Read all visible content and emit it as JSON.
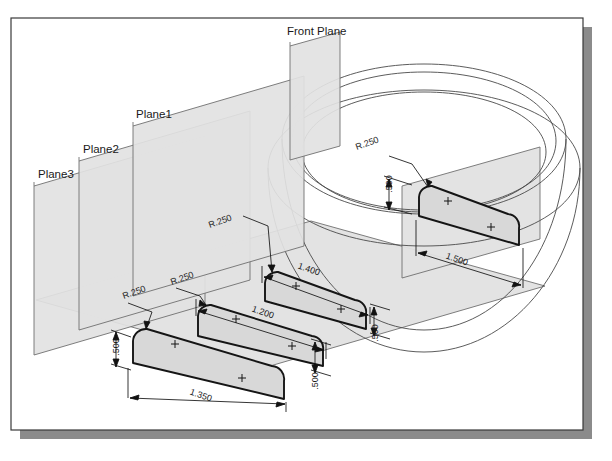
{
  "canvas": {
    "width": 612,
    "height": 461,
    "background": "#ffffff"
  },
  "frame": {
    "name": "drawing-border",
    "x": 11,
    "y": 18,
    "width": 572,
    "height": 412,
    "stroke": "#3a3a3a",
    "shadow_color": "#8b8b8b",
    "shadow_offset": 9
  },
  "style": {
    "plane_fill": "#e2e2e2",
    "plane_stroke": "#6f6f6f",
    "profile_fill": "#d6d6d6",
    "profile_stroke": "#151515",
    "surface_stroke": "#4a4a4a",
    "dimension_stroke": "#121212",
    "text_color": "#1a1a1a"
  },
  "planes": [
    {
      "id": "plane3",
      "label": "Plane3",
      "label_x": 38,
      "label_y": 178,
      "poly": "34,186 34,355 205,305 205,136",
      "selected": false
    },
    {
      "id": "plane2",
      "label": "Plane2",
      "label_x": 83,
      "label_y": 153,
      "poly": "79,161 79,330 250,280 250,111",
      "selected": false
    },
    {
      "id": "plane1",
      "label": "Plane1",
      "label_x": 136,
      "label_y": 118,
      "poly": "133,126 133,296 304,246 304,76",
      "selected": false
    },
    {
      "id": "front-plane",
      "label": "Front Plane",
      "label_x": 287,
      "label_y": 35,
      "poly": "290,46 290,160 340,146 340,32",
      "selected": false
    }
  ],
  "big_plane": {
    "id": "base-plane",
    "poly": "36,300 270,366 545,286 311,221"
  },
  "right_plane": {
    "id": "right-vertical-plane",
    "poly": "402,186 402,278 540,239 540,147"
  },
  "profiles": [
    {
      "id": "profile-plane3",
      "name": "sketch-profile-1350",
      "points": "123,337 129,329 140,325 281,368 281,394 270,399 133,362",
      "center_marks": [
        [
          176,
          348
        ],
        [
          243,
          374
        ]
      ]
    },
    {
      "id": "profile-plane2",
      "name": "sketch-profile-1200",
      "points": "192,313 198,305 209,301 322,339 322,360 312,365 201,335"
    },
    {
      "id": "profile-plane1",
      "name": "sketch-profile-1400",
      "points": "258,282 264,274 275,270 366,303 366,322 357,327 266,301"
    },
    {
      "id": "profile-front",
      "name": "sketch-profile-1500",
      "points": "412,198 418,190 430,187 518,220 518,240 509,245 419,215"
    }
  ],
  "dimensions": [
    {
      "id": "dim-r250-a",
      "label": "R.250",
      "x": 135,
      "y": 295,
      "rotate": -19,
      "font_size": 9
    },
    {
      "id": "dim-r250-b",
      "label": "R.250",
      "x": 183,
      "y": 281,
      "rotate": -19,
      "font_size": 9
    },
    {
      "id": "dim-r250-c",
      "label": "R.250",
      "x": 221,
      "y": 224,
      "rotate": -19,
      "font_size": 9
    },
    {
      "id": "dim-r250-d",
      "label": "R.250",
      "x": 368,
      "y": 146,
      "rotate": -19,
      "font_size": 9
    },
    {
      "id": "dim-500-a",
      "label": ".500",
      "x": 119,
      "y": 347,
      "rotate": -90,
      "font_size": 9
    },
    {
      "id": "dim-500-b",
      "label": ".500",
      "x": 318,
      "y": 381,
      "rotate": -90,
      "font_size": 9
    },
    {
      "id": "dim-500-c",
      "label": ".500",
      "x": 378,
      "y": 333,
      "rotate": -90,
      "font_size": 9
    },
    {
      "id": "dim-500-d",
      "label": ".500",
      "x": 392,
      "y": 184,
      "rotate": -90,
      "font_size": 9
    },
    {
      "id": "dim-1350",
      "label": "1.350",
      "x": 200,
      "y": 398,
      "rotate": 19,
      "font_size": 9
    },
    {
      "id": "dim-1200",
      "label": "1.200",
      "x": 262,
      "y": 315,
      "rotate": 19,
      "font_size": 9
    },
    {
      "id": "dim-1400",
      "label": "1.400",
      "x": 308,
      "y": 272,
      "rotate": 19,
      "font_size": 9
    },
    {
      "id": "dim-1500",
      "label": "1.500",
      "x": 456,
      "y": 262,
      "rotate": 19,
      "font_size": 9
    }
  ],
  "surface": {
    "id": "lofted-revolve-surface",
    "description": "wireframe elliptical loft body",
    "ellipses": [
      {
        "cx": 421,
        "cy": 139,
        "rx": 139,
        "ry": 60,
        "rot": -6
      },
      {
        "cx": 421,
        "cy": 133,
        "rx": 129,
        "ry": 54,
        "rot": -6
      },
      {
        "cx": 415,
        "cy": 152,
        "rx": 148,
        "ry": 65,
        "rot": -6
      }
    ]
  }
}
